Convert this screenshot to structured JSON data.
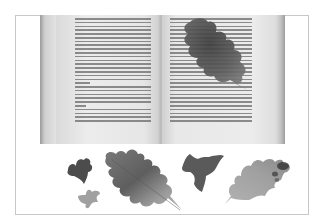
{
  "image": {
    "description": "Grayscale photograph of an open book with a pressed oak leaf resting on the right page, and several pressed leaves (ivy and oak) arranged below the book",
    "colors": {
      "background": "#ffffff",
      "frame_border": "#c8c8c8",
      "page": "#e9e9e9",
      "text_lines": "#6a6a6a",
      "leaf_dark": "#4a4a4a",
      "leaf_mid": "#7a7a7a",
      "leaf_light": "#a8a8a8"
    },
    "objects": [
      {
        "name": "open-book",
        "position": "top center"
      },
      {
        "name": "oak-leaf-on-book",
        "position": "top right page"
      },
      {
        "name": "small-ivy-leaf-dark",
        "position": "bottom left"
      },
      {
        "name": "small-ivy-leaf-light",
        "position": "bottom left, below dark ivy"
      },
      {
        "name": "large-oak-leaf",
        "position": "bottom center-left"
      },
      {
        "name": "ivy-leaf",
        "position": "bottom center-right"
      },
      {
        "name": "oak-leaf-pale",
        "position": "bottom right"
      }
    ]
  }
}
